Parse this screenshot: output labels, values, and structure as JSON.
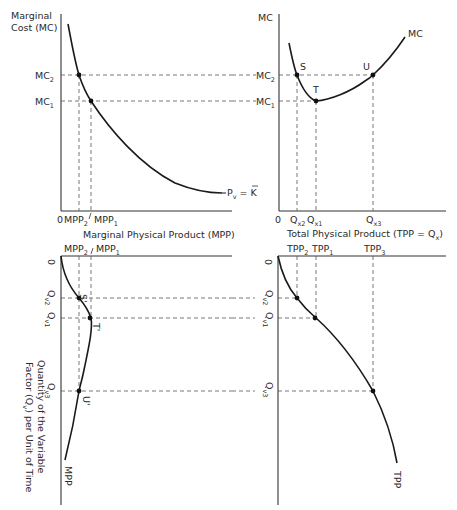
{
  "figure": {
    "panels": {
      "top_left": {
        "y_axis_label_line1": "Marginal",
        "y_axis_label_line2": "Cost (MC)",
        "tick_mc2": "MC",
        "tick_mc2_sub": "2",
        "tick_mc1": "MC",
        "tick_mc1_sub": "1",
        "origin": "0",
        "tick_mpp2": "MPP",
        "tick_mpp2_sub": "2",
        "tick_mpp1": "MPP",
        "tick_mpp1_sub": "1",
        "curve_label": "P",
        "curve_label_sub": "v",
        "curve_label_rest": " = K",
        "x_axis_label": "Marginal Physical Product (MPP)"
      },
      "top_right": {
        "y_axis_label": "MC",
        "tick_mc2": "MC",
        "tick_mc2_sub": "2",
        "tick_mc1": "MC",
        "tick_mc1_sub": "1",
        "curve_label": "MC",
        "point_s": "S",
        "point_t": "T",
        "point_u": "U",
        "origin": "0",
        "tick_qx2": "Q",
        "tick_qx2_sub": "x2",
        "tick_qx1": "Q",
        "tick_qx1_sub": "x1",
        "tick_qx3": "Q",
        "tick_qx3_sub": "x3",
        "x_axis_label": "Total Physical Product (TPP = Q",
        "x_axis_label_sub": "x",
        "x_axis_label_end": ")"
      },
      "bottom_left": {
        "tick_mpp2": "MPP",
        "tick_mpp2_sub": "2",
        "tick_mpp1": "MPP",
        "tick_mpp1_sub": "1",
        "origin": "0",
        "tick_qv2": "Q",
        "tick_qv2_sub": "v2",
        "tick_qv1": "Q",
        "tick_qv1_sub": "v1",
        "tick_qv3": "Q",
        "tick_qv3_sub": "v3",
        "point_s": "S'",
        "point_t": "T'",
        "point_u": "U'",
        "curve_label": "MPP",
        "y_axis_label_line1": "Quantity of the Variable",
        "y_axis_label_line2": "Factor (Q",
        "y_axis_label_line2_sub": "v",
        "y_axis_label_line2_end": ") per Unit of Time"
      },
      "bottom_right": {
        "tick_tpp2": "TPP",
        "tick_tpp2_sub": "2",
        "tick_tpp1": "TPP",
        "tick_tpp1_sub": "1",
        "tick_tpp3": "TPP",
        "tick_tpp3_sub": "3",
        "origin": "0",
        "tick_qv2": "Q",
        "tick_qv2_sub": "v2",
        "tick_qv1": "Q",
        "tick_qv1_sub": "v1",
        "tick_qv3": "Q",
        "tick_qv3_sub": "v3",
        "curve_label": "TPP"
      }
    }
  }
}
